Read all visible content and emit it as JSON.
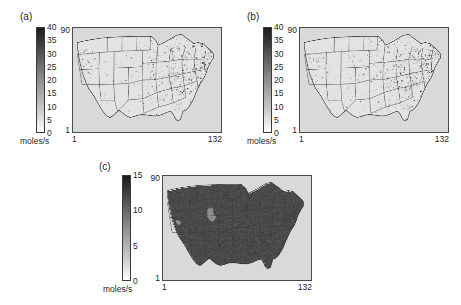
{
  "figure": {
    "units": "moles/s",
    "background_color": "#ffffff",
    "map_background_color": "#d9d9d9"
  },
  "chart_data": {
    "type": "heatmap",
    "title": "",
    "subtitle": "",
    "panel_count": 3,
    "shared": {
      "xlabel": "",
      "ylabel": "",
      "colorbar_label": "moles/s",
      "x_tick_labels": [
        "1",
        "132"
      ],
      "y_tick_labels": [
        "1",
        "90"
      ],
      "xlim": [
        1,
        132
      ],
      "ylim": [
        1,
        90
      ],
      "grid": false,
      "colormap": "gray_reversed",
      "colormap_low_color": "#ffffff",
      "colormap_high_color": "#1a1a1a",
      "legend_position": "left-of-axes",
      "projection_note": "US domain grid indices"
    },
    "panels": [
      {
        "label": "(a)",
        "colorbar": {
          "vmin": 0,
          "vmax": 40,
          "ticks": [
            0,
            5,
            10,
            15,
            20,
            25,
            30,
            35,
            40
          ],
          "tick_labels": [
            "0",
            "5",
            "10",
            "15",
            "20",
            "25",
            "30",
            "35",
            "40"
          ],
          "unit": "moles/s"
        },
        "x_tick_labels": [
          "1",
          "132"
        ],
        "y_tick_labels": [
          "1",
          "90"
        ],
        "field_description": "Sparse point-source emissions, concentrated over the Midwest, Ohio Valley and Northeast US",
        "coverage_fraction": 0.12,
        "seed": 11
      },
      {
        "label": "(b)",
        "colorbar": {
          "vmin": 0,
          "vmax": 40,
          "ticks": [
            0,
            5,
            10,
            15,
            20,
            25,
            30,
            35,
            40
          ],
          "tick_labels": [
            "0",
            "5",
            "10",
            "15",
            "20",
            "25",
            "30",
            "35",
            "40"
          ],
          "unit": "moles/s"
        },
        "x_tick_labels": [
          "1",
          "132"
        ],
        "y_tick_labels": [
          "1",
          "90"
        ],
        "field_description": "Sparse point-source emissions, pattern similar to panel (a) over the eastern US",
        "coverage_fraction": 0.11,
        "seed": 29
      },
      {
        "label": "(c)",
        "colorbar": {
          "vmin": 0,
          "vmax": 15,
          "ticks": [
            0,
            5,
            10,
            15
          ],
          "tick_labels": [
            "0",
            "5",
            "10",
            "15"
          ],
          "unit": "moles/s"
        },
        "x_tick_labels": [
          "1",
          "132"
        ],
        "y_tick_labels": [
          "1",
          "90"
        ],
        "field_description": "Dense continuous area emissions covering nearly the whole US land domain",
        "coverage_fraction": 0.88,
        "seed": 73
      }
    ]
  }
}
